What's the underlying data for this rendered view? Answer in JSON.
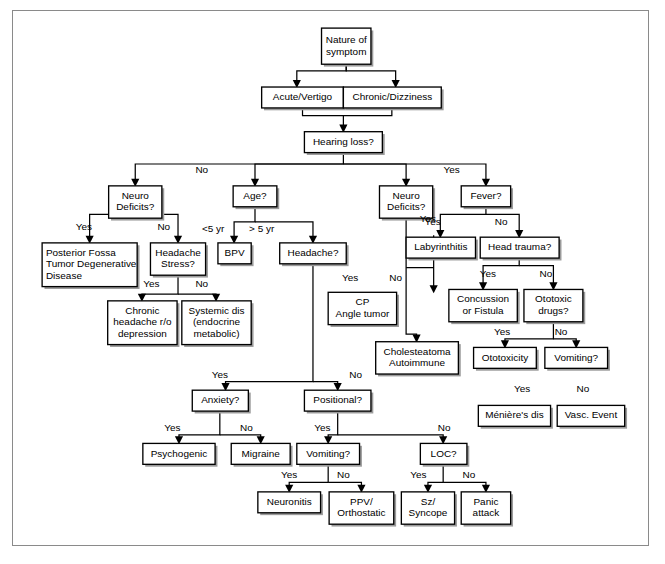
{
  "diagram": {
    "colors": {
      "frame_border": "#8a8a8a",
      "box_border": "#000000",
      "box_fill": "#ffffff",
      "box_shadow": "#9b9b9b",
      "text": "#000000",
      "line": "#000000"
    },
    "nodes": [
      {
        "id": "nature",
        "label": "Nature of\nsymptom",
        "x": 322,
        "y": 18,
        "w": 52,
        "h": 38
      },
      {
        "id": "acute",
        "label": "Acute/Vertigo",
        "x": 259,
        "y": 80,
        "w": 86,
        "h": 22
      },
      {
        "id": "chronic",
        "label": "Chronic/Dizziness",
        "x": 345,
        "y": 80,
        "w": 103,
        "h": 22
      },
      {
        "id": "hearing",
        "label": "Hearing loss?",
        "x": 304,
        "y": 127,
        "w": 82,
        "h": 22
      },
      {
        "id": "neuro_left",
        "label": "Neuro\nDeficits?",
        "x": 98,
        "y": 184,
        "w": 56,
        "h": 34
      },
      {
        "id": "age",
        "label": "Age?",
        "x": 229,
        "y": 184,
        "w": 46,
        "h": 22
      },
      {
        "id": "neuro_right",
        "label": "Neuro\nDeficits?",
        "x": 383,
        "y": 184,
        "w": 56,
        "h": 34
      },
      {
        "id": "fever",
        "label": "Fever?",
        "x": 469,
        "y": 184,
        "w": 52,
        "h": 22
      },
      {
        "id": "posterior",
        "label": "Posterior Fossa\nTumor Degenerative\nDisease",
        "x": 28,
        "y": 244,
        "w": 100,
        "h": 46,
        "align": "left"
      },
      {
        "id": "headache_str",
        "label": "Headache\nStress?",
        "x": 142,
        "y": 244,
        "w": 58,
        "h": 34
      },
      {
        "id": "bpv",
        "label": "BPV",
        "x": 213,
        "y": 244,
        "w": 35,
        "h": 22
      },
      {
        "id": "headache_q",
        "label": "Headache?",
        "x": 278,
        "y": 244,
        "w": 70,
        "h": 22
      },
      {
        "id": "labyrinth",
        "label": "Labyrinthitis",
        "x": 411,
        "y": 238,
        "w": 73,
        "h": 22
      },
      {
        "id": "headtrauma",
        "label": "Head trauma?",
        "x": 489,
        "y": 238,
        "w": 83,
        "h": 22
      },
      {
        "id": "chronic_hd",
        "label": "Chronic\nheadache r/o\ndepression",
        "x": 97,
        "y": 305,
        "w": 73,
        "h": 46
      },
      {
        "id": "systemic",
        "label": "Systemic dis\n(endocrine\nmetabolic)",
        "x": 175,
        "y": 305,
        "w": 73,
        "h": 46
      },
      {
        "id": "cp_angle",
        "label": "CP\nAngle tumor",
        "x": 329,
        "y": 296,
        "w": 72,
        "h": 34
      },
      {
        "id": "concussion",
        "label": "Concussion\nor Fistula",
        "x": 456,
        "y": 293,
        "w": 72,
        "h": 34
      },
      {
        "id": "ototoxic_q",
        "label": "Ototoxic\ndrugs?",
        "x": 535,
        "y": 293,
        "w": 62,
        "h": 34
      },
      {
        "id": "cholesteatoma",
        "label": "Cholesteatoma\nAutoimmune",
        "x": 379,
        "y": 348,
        "w": 87,
        "h": 34
      },
      {
        "id": "ototoxicity",
        "label": "Ototoxicity",
        "x": 482,
        "y": 354,
        "w": 66,
        "h": 22
      },
      {
        "id": "vomiting_r",
        "label": "Vomiting?",
        "x": 557,
        "y": 354,
        "w": 66,
        "h": 22
      },
      {
        "id": "anxiety",
        "label": "Anxiety?",
        "x": 186,
        "y": 399,
        "w": 59,
        "h": 22
      },
      {
        "id": "positional",
        "label": "Positional?",
        "x": 304,
        "y": 399,
        "w": 70,
        "h": 22
      },
      {
        "id": "meniere",
        "label": "Ménière's dis",
        "x": 487,
        "y": 415,
        "w": 76,
        "h": 22
      },
      {
        "id": "vascevent",
        "label": "Vasc. Event",
        "x": 570,
        "y": 415,
        "w": 71,
        "h": 22
      },
      {
        "id": "psychogenic",
        "label": "Psychogenic",
        "x": 134,
        "y": 455,
        "w": 76,
        "h": 22
      },
      {
        "id": "migraine",
        "label": "Migraine",
        "x": 227,
        "y": 455,
        "w": 62,
        "h": 22
      },
      {
        "id": "vomiting_c",
        "label": "Vomiting?",
        "x": 296,
        "y": 455,
        "w": 66,
        "h": 22
      },
      {
        "id": "loc",
        "label": "LOC?",
        "x": 426,
        "y": 455,
        "w": 49,
        "h": 22
      },
      {
        "id": "neuronitis",
        "label": "Neuronitis",
        "x": 255,
        "y": 506,
        "w": 66,
        "h": 22
      },
      {
        "id": "ppv",
        "label": "PPV/\nOrthostatic",
        "x": 330,
        "y": 506,
        "w": 68,
        "h": 34
      },
      {
        "id": "sz",
        "label": "Sz/\nSyncope",
        "x": 406,
        "y": 506,
        "w": 56,
        "h": 34
      },
      {
        "id": "panic",
        "label": "Panic\nattack",
        "x": 469,
        "y": 506,
        "w": 52,
        "h": 34
      }
    ],
    "edge_labels": [
      {
        "text": "No",
        "x": 196,
        "y": 168
      },
      {
        "text": "Yes",
        "x": 459,
        "y": 168
      },
      {
        "text": "Yes",
        "x": 72,
        "y": 228
      },
      {
        "text": "No",
        "x": 156,
        "y": 228
      },
      {
        "text": "<5 yr",
        "x": 208,
        "y": 230
      },
      {
        "text": "> 5 yr",
        "x": 259,
        "y": 230
      },
      {
        "text": "Yes",
        "x": 434,
        "y": 219
      },
      {
        "text": "Yes",
        "x": 439,
        "y": 222
      },
      {
        "text": "No",
        "x": 511,
        "y": 222
      },
      {
        "text": "Yes",
        "x": 143,
        "y": 288
      },
      {
        "text": "No",
        "x": 196,
        "y": 288
      },
      {
        "text": "Yes",
        "x": 352,
        "y": 281
      },
      {
        "text": "No",
        "x": 400,
        "y": 281
      },
      {
        "text": "Yes",
        "x": 497,
        "y": 277
      },
      {
        "text": "No",
        "x": 558,
        "y": 277
      },
      {
        "text": "Yes",
        "x": 512,
        "y": 338
      },
      {
        "text": "No",
        "x": 574,
        "y": 338
      },
      {
        "text": "Yes",
        "x": 215,
        "y": 383
      },
      {
        "text": "No",
        "x": 358,
        "y": 383
      },
      {
        "text": "Yes",
        "x": 533,
        "y": 398
      },
      {
        "text": "No",
        "x": 597,
        "y": 398
      },
      {
        "text": "Yes",
        "x": 165,
        "y": 439
      },
      {
        "text": "No",
        "x": 243,
        "y": 439
      },
      {
        "text": "Yes",
        "x": 323,
        "y": 439
      },
      {
        "text": "No",
        "x": 451,
        "y": 439
      },
      {
        "text": "Yes",
        "x": 288,
        "y": 489
      },
      {
        "text": "No",
        "x": 345,
        "y": 489
      },
      {
        "text": "Yes",
        "x": 424,
        "y": 489
      },
      {
        "text": "No",
        "x": 477,
        "y": 489
      }
    ],
    "edges": [
      {
        "from": "nature",
        "to": "acute",
        "label": ""
      },
      {
        "from": "nature",
        "to": "chronic",
        "label": ""
      },
      {
        "from": "acute",
        "to": "hearing",
        "label": ""
      },
      {
        "from": "chronic",
        "to": "hearing",
        "label": ""
      },
      {
        "from": "hearing",
        "to": "neuro_left",
        "label": "No"
      },
      {
        "from": "hearing",
        "to": "age",
        "label": "No"
      },
      {
        "from": "hearing",
        "to": "neuro_right",
        "label": "Yes"
      },
      {
        "from": "hearing",
        "to": "fever",
        "label": "Yes"
      },
      {
        "from": "neuro_left",
        "to": "posterior",
        "label": "Yes"
      },
      {
        "from": "neuro_left",
        "to": "headache_str",
        "label": "No"
      },
      {
        "from": "age",
        "to": "bpv",
        "label": "<5 yr"
      },
      {
        "from": "age",
        "to": "headache_q",
        "label": "> 5 yr"
      },
      {
        "from": "neuro_right",
        "to": "cp_angle",
        "label": "Yes"
      },
      {
        "from": "neuro_right",
        "to": "cholesteatoma",
        "label": "No"
      },
      {
        "from": "fever",
        "to": "labyrinth",
        "label": "Yes"
      },
      {
        "from": "fever",
        "to": "headtrauma",
        "label": "No"
      },
      {
        "from": "headache_str",
        "to": "chronic_hd",
        "label": "Yes"
      },
      {
        "from": "headache_str",
        "to": "systemic",
        "label": "No"
      },
      {
        "from": "headtrauma",
        "to": "concussion",
        "label": "Yes"
      },
      {
        "from": "headtrauma",
        "to": "ototoxic_q",
        "label": "No"
      },
      {
        "from": "ototoxic_q",
        "to": "ototoxicity",
        "label": "Yes"
      },
      {
        "from": "ototoxic_q",
        "to": "vomiting_r",
        "label": "No"
      },
      {
        "from": "vomiting_r",
        "to": "meniere",
        "label": "Yes"
      },
      {
        "from": "vomiting_r",
        "to": "vascevent",
        "label": "No"
      },
      {
        "from": "headache_q",
        "to": "anxiety",
        "label": "Yes"
      },
      {
        "from": "headache_q",
        "to": "positional",
        "label": "No"
      },
      {
        "from": "anxiety",
        "to": "psychogenic",
        "label": "Yes"
      },
      {
        "from": "anxiety",
        "to": "migraine",
        "label": "No"
      },
      {
        "from": "positional",
        "to": "vomiting_c",
        "label": "Yes"
      },
      {
        "from": "positional",
        "to": "loc",
        "label": "No"
      },
      {
        "from": "vomiting_c",
        "to": "neuronitis",
        "label": "Yes"
      },
      {
        "from": "vomiting_c",
        "to": "ppv",
        "label": "No"
      },
      {
        "from": "loc",
        "to": "sz",
        "label": "Yes"
      },
      {
        "from": "loc",
        "to": "panic",
        "label": "No"
      }
    ],
    "paths": [
      "M348,56 L348,63 L296,63 L296,74",
      "M348,56 L348,63 L400,63 L400,74",
      "M302,102 L302,110 L345,110 L345,121",
      "M396,102 L396,110 L345,110",
      "M345,149 L345,161 L126,161 L126,178",
      "M345,161 L252,161 L252,178",
      "M345,161 L411,161 L411,178",
      "M345,161 L495,161 L495,178",
      "M126,206 L126,214 L78,214 L78,238",
      "M126,214 L171,214 L171,238",
      "M252,206 L252,222 L230,222 L230,238",
      "M252,222 L313,222 L313,238",
      "M411,218 L411,340 L422,340 L422,342",
      "M411,270 L440,270 L440,236 L440,290",
      "M495,206 L495,214 L447,214 L447,232",
      "M495,214 L530,214 L530,232",
      "M171,278 L171,298 L133,298 L133,299",
      "M171,298 L211,298 L211,299",
      "M530,260 L530,268 L492,268 L492,287",
      "M530,268 L566,268 L566,287",
      "M566,327 L566,345 L515,345 L515,348",
      "M566,345 L590,345 L590,348",
      "M313,266 L313,390 L221,390 L221,393",
      "M313,390 L339,390 L339,393",
      "M215,421 L215,446 L172,446 L172,449",
      "M215,446 L258,446 L258,449",
      "M339,421 L339,446 L329,446 L329,449",
      "M339,446 L450,446 L450,449",
      "M329,477 L329,496 L288,496 L288,500",
      "M329,496 L364,496 L364,500",
      "M450,477 L450,496 L434,496 L434,500",
      "M450,496 L495,496 L495,500"
    ]
  }
}
